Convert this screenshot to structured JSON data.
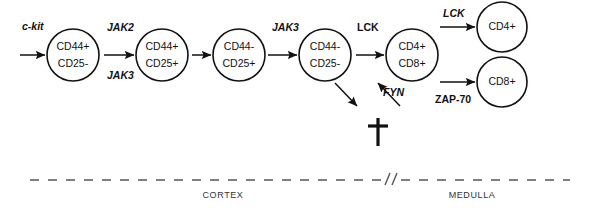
{
  "figure": {
    "stroke_color": "#111111",
    "boundary_color": "#555555",
    "background": "#ffffff"
  },
  "cells": [
    {
      "id": "dn1",
      "line1": "CD44+",
      "line2": "CD25-",
      "cx": 73,
      "cy": 55,
      "r": 26
    },
    {
      "id": "dn2",
      "line1": "CD44+",
      "line2": "CD25+",
      "cx": 162,
      "cy": 55,
      "r": 26
    },
    {
      "id": "dn3",
      "line1": "CD44-",
      "line2": "CD25+",
      "cx": 239,
      "cy": 55,
      "r": 26
    },
    {
      "id": "dn4",
      "line1": "CD44-",
      "line2": "CD25-",
      "cx": 325,
      "cy": 55,
      "r": 26
    },
    {
      "id": "dp",
      "line1": "CD4+",
      "line2": "CD8+",
      "cx": 412,
      "cy": 55,
      "r": 26
    },
    {
      "id": "sp-cd4",
      "line1": "CD4+",
      "line2": "",
      "cx": 502,
      "cy": 27,
      "r": 25
    },
    {
      "id": "sp-cd8",
      "line1": "CD8+",
      "line2": "",
      "cx": 502,
      "cy": 82,
      "r": 25
    }
  ],
  "kinases": [
    {
      "id": "c-kit",
      "label": "c-kit",
      "style": "italic",
      "x": 22,
      "y": 30
    },
    {
      "id": "jak2",
      "label": "JAK2",
      "style": "italic",
      "x": 107,
      "y": 31
    },
    {
      "id": "jak3",
      "label": "JAK3",
      "style": "italic",
      "x": 107,
      "y": 79
    },
    {
      "id": "jak3-b",
      "label": "JAK3",
      "style": "italic",
      "x": 272,
      "y": 31
    },
    {
      "id": "lck-bold",
      "label": "LCK",
      "style": "bold",
      "x": 357,
      "y": 31
    },
    {
      "id": "fyn",
      "label": "FYN",
      "style": "italic",
      "x": 383,
      "y": 96
    },
    {
      "id": "lck-it",
      "label": "LCK",
      "style": "italic",
      "x": 443,
      "y": 17
    },
    {
      "id": "zap70",
      "label": "ZAP-70",
      "style": "bold",
      "x": 435,
      "y": 103
    }
  ],
  "arrows": [
    {
      "id": "arrow-entry",
      "x1": 20,
      "y1": 55,
      "x2": 45,
      "y2": 55
    },
    {
      "id": "arrow-dn1-dn2",
      "x1": 104,
      "y1": 55,
      "x2": 134,
      "y2": 55
    },
    {
      "id": "arrow-dn2-dn3",
      "x1": 192,
      "y1": 55,
      "x2": 211,
      "y2": 55
    },
    {
      "id": "arrow-dn3-dn4",
      "x1": 268,
      "y1": 55,
      "x2": 297,
      "y2": 55
    },
    {
      "id": "arrow-dn4-dp",
      "x1": 356,
      "y1": 55,
      "x2": 384,
      "y2": 55
    },
    {
      "id": "arrow-dp-cd4",
      "x1": 440,
      "y1": 27,
      "x2": 475,
      "y2": 27
    },
    {
      "id": "arrow-dp-cd8",
      "x1": 440,
      "y1": 82,
      "x2": 475,
      "y2": 82
    },
    {
      "id": "arrow-death-left",
      "x1": 335,
      "y1": 83,
      "x2": 357,
      "y2": 106
    },
    {
      "id": "arrow-death-right",
      "x1": 400,
      "y1": 106,
      "x2": 378,
      "y2": 83
    }
  ],
  "death_marker": {
    "id": "apoptosis-dagger",
    "symbol": "dagger",
    "cx": 378,
    "cy": 132,
    "height": 28,
    "arm_width": 20,
    "arm_y_offset": 8
  },
  "boundary": {
    "y": 180,
    "x_start": 30,
    "x_end": 570,
    "break_x": 392,
    "break_label": "//"
  },
  "zones": [
    {
      "id": "cortex",
      "label": "CORTEX",
      "x": 223,
      "y": 198
    },
    {
      "id": "medulla",
      "label": "MEDULLA",
      "x": 472,
      "y": 198
    }
  ]
}
